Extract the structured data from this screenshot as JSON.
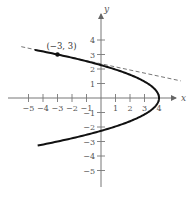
{
  "chart_data": {
    "type": "line",
    "title": "",
    "xlabel": "x",
    "ylabel": "y",
    "xlim": [
      -5.5,
      5.5
    ],
    "ylim": [
      -5.5,
      5
    ],
    "grid": false,
    "x_ticks": [
      -5,
      -4,
      -3,
      -2,
      -1,
      1,
      2,
      3,
      4
    ],
    "y_ticks": [
      -5,
      -4,
      -3,
      -2,
      -1,
      1,
      2,
      3,
      4
    ],
    "x_tick_labels": [
      "−5",
      "−4",
      "−3",
      "−2",
      "−1",
      "1",
      "2",
      "3",
      "4"
    ],
    "y_tick_labels": [
      "−5",
      "−4",
      "−3",
      "−2",
      "−1",
      "1",
      "2",
      "3",
      "4"
    ],
    "series": [
      {
        "name": "parabola x = 4 − (7/9)y²",
        "style": "solid",
        "points": [
          [
            -5.5,
            3.3
          ],
          [
            -3,
            3
          ],
          [
            0,
            2.27
          ],
          [
            2,
            1.6
          ],
          [
            3,
            1.13
          ],
          [
            4,
            0
          ],
          [
            3,
            -1.13
          ],
          [
            2,
            -1.6
          ],
          [
            0,
            -2.27
          ],
          [
            -3,
            -3
          ],
          [
            -5.5,
            -3.3
          ]
        ]
      },
      {
        "name": "tangent line at (-3, 3)",
        "style": "dashed",
        "points": [
          [
            -5.5,
            3.54
          ],
          [
            5.5,
            1.18
          ]
        ]
      }
    ],
    "annotations": [
      {
        "text": "(−3, 3)",
        "x": -3,
        "y": 3,
        "marker": "dot"
      }
    ]
  }
}
